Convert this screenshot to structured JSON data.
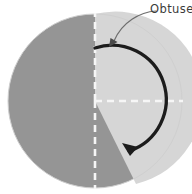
{
  "figure": {
    "kind": "geometry-diagram",
    "title": "",
    "annotation": {
      "label": "Obtuse a",
      "label_full_visible": "Obtuse",
      "truncated_at_right_edge": true
    }
  },
  "colors": {
    "dark_sector": "#959595",
    "light_sector": "#d6d6d6",
    "dashed_radius": "#f4f4f4",
    "arrow": "#1c1c1c",
    "leader": "#6e6e6e",
    "text": "#3b3b3b",
    "background": "#ffffff"
  },
  "circle": {
    "center_x": 95,
    "center_y": 101,
    "radius": 87
  },
  "regions": [
    {
      "name": "dark-region",
      "description": "left half of circle plus lower-right sector",
      "fill": "#959595",
      "start_angle_deg": 270,
      "end_angle_deg": 62
    },
    {
      "name": "light-region",
      "description": "upper-right quadrant and part of lower-right",
      "fill": "#d6d6d6",
      "start_angle_deg": 270,
      "end_angle_deg": 62
    }
  ],
  "radii": [
    {
      "name": "vertical-dashed-radius-up",
      "angle_deg": 90,
      "style": "dashed"
    },
    {
      "name": "vertical-dashed-radius-down",
      "angle_deg": 270,
      "style": "dashed"
    },
    {
      "name": "horizontal-dashed-radius-right",
      "angle_deg": 0,
      "style": "dashed"
    }
  ],
  "angle_arrow": {
    "name": "obtuse-angle-sweep",
    "direction": "clockwise",
    "start_angle_deg": 90,
    "end_angle_deg": 332,
    "sweep_deg": 118,
    "stroke_width": 3.2
  },
  "leader_arrow": {
    "name": "label-leader",
    "from_x": 157,
    "from_y": 10,
    "to_x": 112,
    "to_y": 46
  }
}
